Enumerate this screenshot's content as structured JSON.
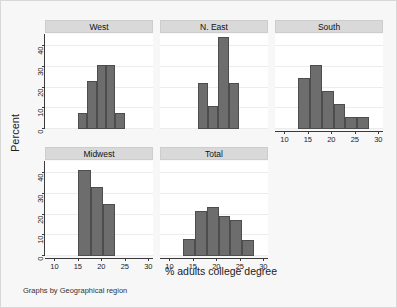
{
  "chart_data": {
    "type": "bar",
    "title": "",
    "xlabel": "% adults college degree",
    "ylabel": "Percent",
    "note": "Graphs by Geographical region",
    "xlim": [
      8,
      31
    ],
    "ylim": [
      0,
      46
    ],
    "xticks": [
      10,
      15,
      20,
      25,
      30
    ],
    "yticks": [
      0,
      10,
      20,
      30,
      40
    ],
    "xticklabels": [
      "10",
      "15",
      "20",
      "25",
      "30"
    ],
    "yticklabels": [
      "0",
      "10",
      "20",
      "30",
      "40"
    ],
    "grid": "horizontal",
    "legend": "none",
    "bar_color": "#6d6d6d",
    "bar_edge_color": "#4d4d4d",
    "panel_header_color": "#d9d9d9",
    "background_color": "#f7f7f7",
    "plot_background_color": "#ffffff",
    "panels": [
      {
        "label": "West",
        "bins": [
          {
            "left": 15.0,
            "right": 17.0,
            "value": 7.7
          },
          {
            "left": 17.0,
            "right": 19.0,
            "value": 23.1
          },
          {
            "left": 19.0,
            "right": 21.0,
            "value": 30.8
          },
          {
            "left": 21.0,
            "right": 23.0,
            "value": 30.8
          },
          {
            "left": 23.0,
            "right": 25.0,
            "value": 7.7
          }
        ]
      },
      {
        "label": "N. East",
        "bins": [
          {
            "left": 16.0,
            "right": 18.2,
            "value": 22.2
          },
          {
            "left": 18.2,
            "right": 20.4,
            "value": 11.1
          },
          {
            "left": 20.4,
            "right": 22.6,
            "value": 44.4
          },
          {
            "left": 22.6,
            "right": 24.8,
            "value": 22.2
          }
        ]
      },
      {
        "label": "South",
        "bins": [
          {
            "left": 13.0,
            "right": 15.5,
            "value": 24.5
          },
          {
            "left": 15.5,
            "right": 18.0,
            "value": 31.0
          },
          {
            "left": 18.0,
            "right": 20.5,
            "value": 18.5
          },
          {
            "left": 20.5,
            "right": 23.0,
            "value": 12.0
          },
          {
            "left": 23.0,
            "right": 25.5,
            "value": 6.0
          },
          {
            "left": 25.5,
            "right": 28.0,
            "value": 6.0
          }
        ]
      },
      {
        "label": "Midwest",
        "bins": [
          {
            "left": 15.0,
            "right": 17.7,
            "value": 41.7
          },
          {
            "left": 17.7,
            "right": 20.3,
            "value": 33.3
          },
          {
            "left": 20.3,
            "right": 23.0,
            "value": 25.0
          }
        ]
      },
      {
        "label": "Total",
        "bins": [
          {
            "left": 13.0,
            "right": 15.5,
            "value": 8.0
          },
          {
            "left": 15.5,
            "right": 18.0,
            "value": 21.6
          },
          {
            "left": 18.0,
            "right": 20.5,
            "value": 23.5
          },
          {
            "left": 20.5,
            "right": 23.0,
            "value": 19.6
          },
          {
            "left": 23.0,
            "right": 25.5,
            "value": 17.6
          },
          {
            "left": 25.5,
            "right": 28.0,
            "value": 7.8
          }
        ]
      }
    ]
  }
}
